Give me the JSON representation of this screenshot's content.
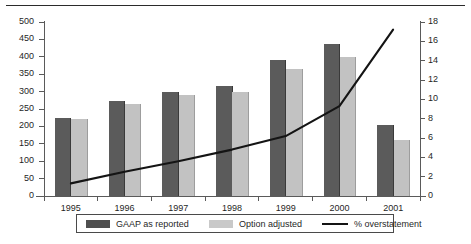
{
  "figure": {
    "top_rule": "horizontal-rule"
  },
  "legend": {
    "items": [
      {
        "label": "GAAP as reported",
        "swatch": "bar-dark-swatch",
        "color": "#4f4f4f"
      },
      {
        "label": "Option adjusted",
        "swatch": "bar-light-swatch",
        "color": "#c9c9c9"
      },
      {
        "label": "% overstatement",
        "swatch": "line-swatch",
        "color": "#141414"
      }
    ]
  },
  "chart_data": {
    "type": "bar",
    "title": "",
    "xlabel": "",
    "ylabel": "",
    "categories": [
      "1995",
      "1996",
      "1997",
      "1998",
      "1999",
      "2000",
      "2001"
    ],
    "series": [
      {
        "name": "GAAP as reported",
        "type": "bar",
        "axis": "left",
        "color": "#5b5b5b",
        "values": [
          225,
          272,
          298,
          315,
          390,
          437,
          205
        ]
      },
      {
        "name": "Option adjusted",
        "type": "bar",
        "axis": "left",
        "color": "#c2c2c2",
        "values": [
          220,
          265,
          290,
          298,
          365,
          400,
          160
        ]
      },
      {
        "name": "% overstatement",
        "type": "line",
        "axis": "right",
        "color": "#141414",
        "values": [
          1.3,
          2.5,
          3.6,
          4.8,
          6.2,
          9.3,
          17.2
        ]
      }
    ],
    "left_axis": {
      "min": 0,
      "max": 500,
      "step": 50,
      "ticks": [
        "0",
        "50",
        "100",
        "150",
        "200",
        "250",
        "300",
        "350",
        "400",
        "450",
        "500"
      ]
    },
    "right_axis": {
      "min": 0,
      "max": 18,
      "step": 2,
      "ticks": [
        "0",
        "2",
        "4",
        "6",
        "8",
        "10",
        "12",
        "14",
        "16",
        "18"
      ]
    },
    "grid": false,
    "legend_position": "bottom"
  }
}
